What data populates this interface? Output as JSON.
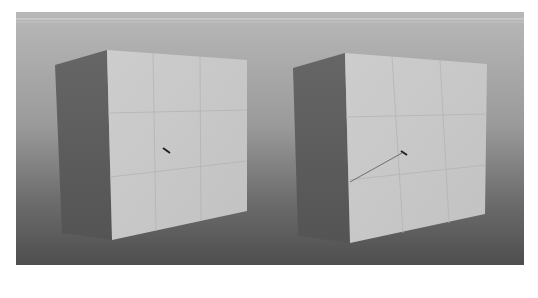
{
  "viewport": {
    "label": "3d-viewport",
    "background": {
      "top": "#b4b4b4",
      "horizon": "#8e8e8e",
      "floor": "#5a5a5a"
    },
    "header_line_color": "#d8d8d8"
  },
  "cubes": [
    {
      "name": "left-cube",
      "front_face_color": "#c8c8c8",
      "side_face_color": "#5e5e5e",
      "grid_color": "#b2b2b2",
      "pivot_marker": {
        "x": 167,
        "y": 151
      }
    },
    {
      "name": "right-cube",
      "front_face_color": "#c8c8c8",
      "side_face_color": "#5e5e5e",
      "grid_color": "#b2b2b2",
      "pivot_marker": {
        "x": 404,
        "y": 153
      },
      "guide_line": {
        "x1": 350,
        "y1": 182,
        "x2": 402,
        "y2": 153
      }
    }
  ]
}
